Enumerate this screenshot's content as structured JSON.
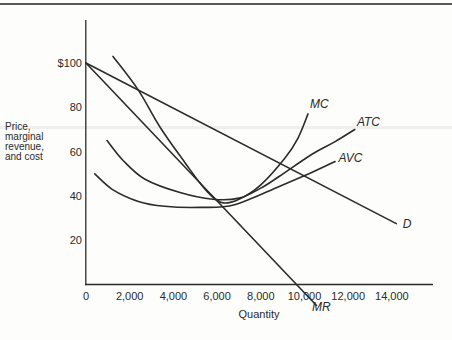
{
  "page": {
    "background": "#fdfdfb",
    "top_rule_color": "#57585a",
    "ink_color": "#2a2a2a",
    "artifact_band_color": "#efefec"
  },
  "chart_data": {
    "type": "line",
    "title": "",
    "xlabel": "Quantity",
    "ylabel_lines": [
      "Price,",
      "marginal",
      "revenue,",
      "and cost"
    ],
    "xlim": [
      0,
      15900
    ],
    "ylim": [
      0,
      119
    ],
    "grid": false,
    "legend_position": "none",
    "line_color": "#2b2b2b",
    "x_ticks": [
      {
        "value": 0,
        "label": "0"
      },
      {
        "value": 2000,
        "label": "2,000"
      },
      {
        "value": 4000,
        "label": "4,000"
      },
      {
        "value": 6000,
        "label": "6,000"
      },
      {
        "value": 8000,
        "label": "8,000"
      },
      {
        "value": 10000,
        "label": "10,000"
      },
      {
        "value": 12000,
        "label": "12,000"
      },
      {
        "value": 14000,
        "label": "14,000"
      }
    ],
    "y_ticks": [
      {
        "value": 100,
        "label": "$100"
      },
      {
        "value": 80,
        "label": "80"
      },
      {
        "value": 60,
        "label": "60"
      },
      {
        "value": 40,
        "label": "40"
      },
      {
        "value": 20,
        "label": "20"
      }
    ],
    "series": [
      {
        "name": "demand",
        "label": "D",
        "points": [
          [
            0,
            100
          ],
          [
            14200,
            27.5
          ]
        ],
        "label_at": [
          14500,
          25.5
        ]
      },
      {
        "name": "marginal-revenue",
        "label": "MR",
        "points": [
          [
            0,
            100
          ],
          [
            10550,
            -9.5
          ]
        ],
        "label_at": [
          10350,
          -12
        ]
      },
      {
        "name": "marginal-cost",
        "label": "MC",
        "points": [
          [
            1235,
            103
          ],
          [
            2380,
            88
          ],
          [
            3390,
            71
          ],
          [
            4530,
            55
          ],
          [
            5450,
            43
          ],
          [
            6200,
            37
          ],
          [
            7000,
            38.5
          ],
          [
            8000,
            45
          ],
          [
            9100,
            57
          ],
          [
            9700,
            66
          ],
          [
            10160,
            77
          ]
        ],
        "label_at": [
          10250,
          79.5
        ]
      },
      {
        "name": "average-total-cost",
        "label": "ATC",
        "points": [
          [
            960,
            65
          ],
          [
            1700,
            56
          ],
          [
            2700,
            47.5
          ],
          [
            4300,
            41.5
          ],
          [
            5800,
            38.5
          ],
          [
            7000,
            39
          ],
          [
            8000,
            43.5
          ],
          [
            8870,
            49
          ],
          [
            10380,
            59
          ],
          [
            11400,
            64.5
          ],
          [
            12300,
            70
          ]
        ],
        "label_at": [
          12400,
          71.5
        ]
      },
      {
        "name": "average-variable-cost",
        "label": "AVC",
        "points": [
          [
            400,
            50
          ],
          [
            1200,
            43
          ],
          [
            2400,
            37.5
          ],
          [
            3600,
            35.3
          ],
          [
            5200,
            34.8
          ],
          [
            6800,
            36
          ],
          [
            8870,
            44.4
          ],
          [
            10200,
            50
          ],
          [
            11400,
            55.5
          ]
        ],
        "label_at": [
          11550,
          55.5
        ]
      }
    ]
  }
}
